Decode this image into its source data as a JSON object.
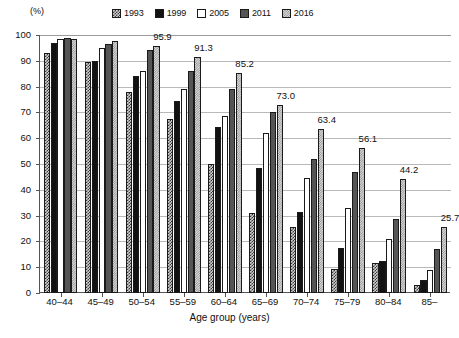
{
  "unit_label": "(%)",
  "legend": {
    "items": [
      {
        "label": "1993",
        "pattern": "checker-dark"
      },
      {
        "label": "1999",
        "pattern": "solid-black"
      },
      {
        "label": "2005",
        "pattern": "white-outline"
      },
      {
        "label": "2011",
        "pattern": "solid-darkgray"
      },
      {
        "label": "2016",
        "pattern": "checker-light"
      }
    ]
  },
  "chart_data": {
    "type": "bar",
    "title": "",
    "xlabel": "Age group (years)",
    "ylabel": "(%)",
    "ylim": [
      0,
      100
    ],
    "ytick_labels": [
      "100",
      "90",
      "80",
      "70",
      "60",
      "50",
      "40",
      "30",
      "20",
      "10",
      "0"
    ],
    "ytick_values": [
      100,
      90,
      80,
      70,
      60,
      50,
      40,
      30,
      20,
      10,
      0
    ],
    "grid": true,
    "legend_position": "top",
    "categories": [
      "40–44",
      "45–49",
      "50–54",
      "55–59",
      "60–64",
      "65–69",
      "70–74",
      "75–79",
      "80–84",
      "85–"
    ],
    "series": [
      {
        "name": "1993",
        "values": [
          93.0,
          89.5,
          78.0,
          67.5,
          50.0,
          31.0,
          25.5,
          9.5,
          11.5,
          3.0
        ]
      },
      {
        "name": "1999",
        "values": [
          97.0,
          90.0,
          84.0,
          74.5,
          64.5,
          48.5,
          31.5,
          17.5,
          12.5,
          5.0
        ]
      },
      {
        "name": "2005",
        "values": [
          98.5,
          95.0,
          86.0,
          79.0,
          68.5,
          62.0,
          44.5,
          33.0,
          21.0,
          9.0
        ]
      },
      {
        "name": "2011",
        "values": [
          99.0,
          96.5,
          94.0,
          86.0,
          79.0,
          70.0,
          52.0,
          47.0,
          28.5,
          17.0
        ]
      },
      {
        "name": "2016",
        "values": [
          98.5,
          97.5,
          95.9,
          91.3,
          85.2,
          73.0,
          63.4,
          56.1,
          44.2,
          25.7
        ]
      }
    ],
    "annotations": [
      {
        "category": "50–54",
        "series": "2016",
        "text": "95.9"
      },
      {
        "category": "55–59",
        "series": "2016",
        "text": "91.3"
      },
      {
        "category": "60–64",
        "series": "2016",
        "text": "85.2"
      },
      {
        "category": "65–69",
        "series": "2016",
        "text": "73.0"
      },
      {
        "category": "70–74",
        "series": "2016",
        "text": "63.4"
      },
      {
        "category": "75–79",
        "series": "2016",
        "text": "56.1"
      },
      {
        "category": "80–84",
        "series": "2016",
        "text": "44.2"
      },
      {
        "category": "85–",
        "series": "2016",
        "text": "25.7"
      }
    ]
  }
}
